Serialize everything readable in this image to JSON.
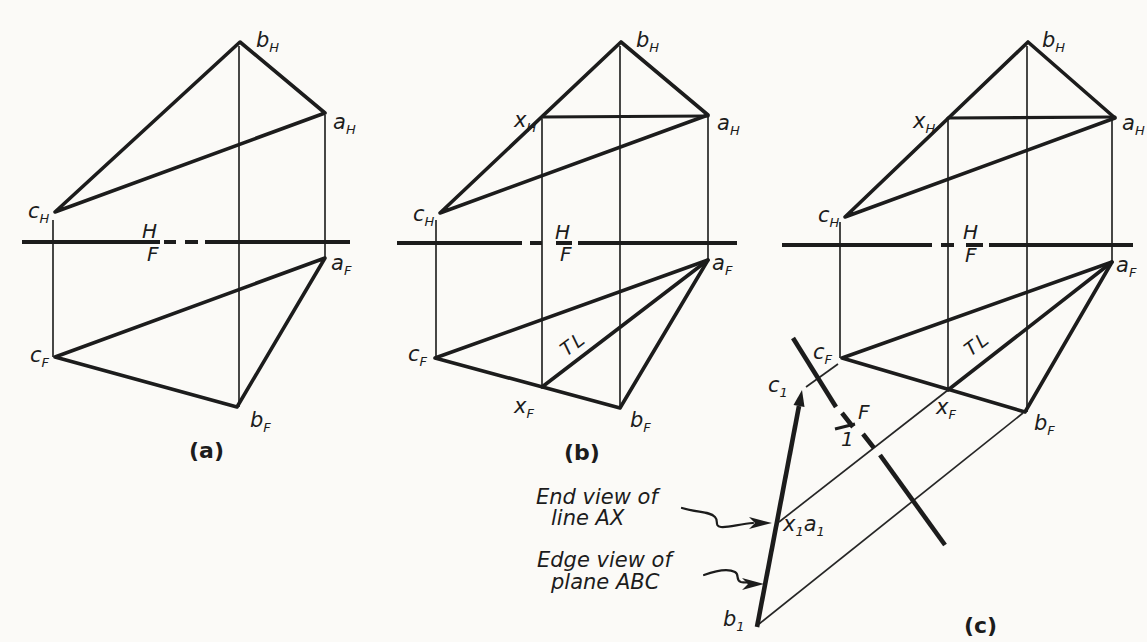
{
  "colors": {
    "ink": "#1c1c1c",
    "paper": "#fbfaf7"
  },
  "figures": {
    "a": {
      "caption": "(a)",
      "fold": [
        "H",
        "F"
      ],
      "points": {
        "bH": [
          "b",
          "H"
        ],
        "aH": [
          "a",
          "H"
        ],
        "cH": [
          "c",
          "H"
        ],
        "cF": [
          "c",
          "F"
        ],
        "aF": [
          "a",
          "F"
        ],
        "bF": [
          "b",
          "F"
        ]
      }
    },
    "b": {
      "caption": "(b)",
      "fold": [
        "H",
        "F"
      ],
      "tl": "TL",
      "points": {
        "bH": [
          "b",
          "H"
        ],
        "aH": [
          "a",
          "H"
        ],
        "xH": [
          "x",
          "H"
        ],
        "cH": [
          "c",
          "H"
        ],
        "cF": [
          "c",
          "F"
        ],
        "aF": [
          "a",
          "F"
        ],
        "xF": [
          "x",
          "F"
        ],
        "bF": [
          "b",
          "F"
        ]
      }
    },
    "c": {
      "caption": "(c)",
      "fold": [
        "H",
        "F"
      ],
      "tl": "TL",
      "points": {
        "bH": [
          "b",
          "H"
        ],
        "aH": [
          "a",
          "H"
        ],
        "xH": [
          "x",
          "H"
        ],
        "cH": [
          "c",
          "H"
        ],
        "cF": [
          "c",
          "F"
        ],
        "aF": [
          "a",
          "F"
        ],
        "xF": [
          "x",
          "F"
        ],
        "bF": [
          "b",
          "F"
        ]
      }
    },
    "aux": {
      "fold": [
        "F",
        "1"
      ],
      "points": {
        "c1": [
          "c",
          "1"
        ],
        "x1a1": [
          "x",
          "1",
          "a",
          "1"
        ],
        "b1": [
          "b",
          "1"
        ]
      },
      "annotations": {
        "end_view": [
          "End view of",
          "line AX"
        ],
        "edge_view": [
          "Edge view of",
          "plane ABC"
        ]
      }
    }
  }
}
